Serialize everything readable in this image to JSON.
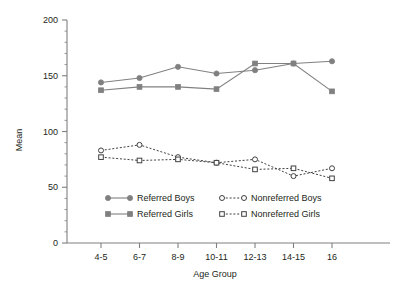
{
  "chart_data": {
    "type": "line",
    "title": "",
    "xlabel": "Age Group",
    "ylabel": "Mean",
    "categories": [
      "4-5",
      "6-7",
      "8-9",
      "10-11",
      "12-13",
      "14-15",
      "16"
    ],
    "ylim": [
      0,
      200
    ],
    "ytick_labels": [
      "0",
      "50",
      "100",
      "150",
      "200"
    ],
    "ytick_values": [
      0,
      50,
      100,
      150,
      200
    ],
    "ytick_minor_step": 10,
    "grid": false,
    "legend_position": "inside-bottom-center",
    "series": [
      {
        "name": "Referred Boys",
        "values": [
          144,
          148,
          158,
          152,
          155,
          161,
          163
        ],
        "color": "#808080",
        "marker": "filled-circle",
        "linestyle": "solid"
      },
      {
        "name": "Referred Girls",
        "values": [
          137,
          140,
          140,
          138,
          161,
          161,
          136
        ],
        "color": "#808080",
        "marker": "filled-square",
        "linestyle": "solid"
      },
      {
        "name": "Nonreferred Boys",
        "values": [
          83,
          88,
          77,
          72,
          75,
          60,
          67
        ],
        "color": "#404040",
        "marker": "open-circle",
        "linestyle": "dotted"
      },
      {
        "name": "Nonreferred Girls",
        "values": [
          77,
          74,
          75,
          72,
          66,
          67,
          58
        ],
        "color": "#404040",
        "marker": "open-square",
        "linestyle": "dotted"
      }
    ]
  },
  "legend": {
    "entries": [
      {
        "label": "Referred Boys"
      },
      {
        "label": "Nonreferred Boys"
      },
      {
        "label": "Referred Girls"
      },
      {
        "label": "Nonreferred Girls"
      }
    ]
  },
  "colors": {
    "referred": "#808080",
    "nonreferred": "#404040",
    "axis": "#808080",
    "text": "#231f20",
    "background": "#ffffff"
  }
}
